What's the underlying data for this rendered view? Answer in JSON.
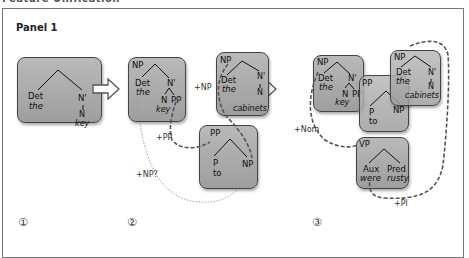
{
  "header": {
    "cut_title": "Feature Unification"
  },
  "panel": {
    "title": "Panel 1"
  },
  "steps": [
    {
      "number": "①",
      "trees": [
        {
          "name": "tree-det-n",
          "labels": {
            "det": "Det",
            "det_word": "the",
            "nbar": "N'",
            "n": "N",
            "n_word": "key"
          }
        }
      ]
    },
    {
      "number": "②",
      "trees": [
        {
          "name": "tree-np-key",
          "labels": {
            "root": "NP",
            "det": "Det",
            "det_word": "the",
            "nbar": "N'",
            "n": "N",
            "pp": "PP",
            "n_word": "key"
          }
        },
        {
          "name": "tree-np-cabinets",
          "labels": {
            "root": "NP",
            "det": "Det",
            "det_word": "the",
            "nbar": "N'",
            "n": "N",
            "n_word": "cabinets"
          }
        },
        {
          "name": "tree-pp",
          "labels": {
            "root": "PP",
            "p": "P",
            "p_word": "to",
            "np": "NP"
          }
        }
      ],
      "features": {
        "np": "+NP",
        "pp": "+PP",
        "np_q": "+NP?"
      }
    },
    {
      "number": "③",
      "trees": [
        {
          "name": "tree-np-key",
          "labels": {
            "root": "NP",
            "det": "Det",
            "det_word": "the",
            "nbar": "N'",
            "n": "N",
            "pp": "PP",
            "n_word": "key"
          }
        },
        {
          "name": "tree-pp",
          "labels": {
            "root": "PP",
            "p": "P",
            "p_word": "to",
            "np": "NP"
          }
        },
        {
          "name": "tree-np-cabinets",
          "labels": {
            "root": "NP",
            "det": "Det",
            "det_word": "the",
            "nbar": "N'",
            "n": "N",
            "n_word": "cabinets"
          }
        },
        {
          "name": "tree-vp",
          "labels": {
            "root": "VP",
            "aux": "Aux",
            "aux_word": "were",
            "pred": "Pred",
            "pred_word": "rusty"
          }
        }
      ],
      "features": {
        "nom": "+Nom",
        "pl": "+Pl"
      }
    }
  ],
  "colors": {
    "box_top": "#b9b9b9",
    "box_bottom": "#9e9e9e",
    "border": "#444444",
    "arrow_fill": "#ffffff",
    "dash": "#555555",
    "dot": "#999999"
  }
}
